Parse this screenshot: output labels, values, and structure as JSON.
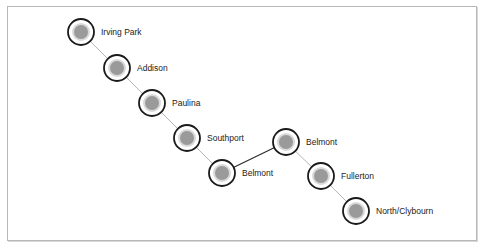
{
  "diagram": {
    "type": "transit-line-network",
    "colors": {
      "frame_border": "#b8b8b8",
      "node_ring": "#1a1a1a",
      "node_halo": "#ffffff",
      "node_inner_ring": "#d9d9d9",
      "node_fill": "#9a9a9a",
      "edge_light": "#b5b5b5",
      "edge_dark": "#2a2a2a",
      "label_text": "#222222"
    },
    "nodes": [
      {
        "id": "irving-park",
        "label": "Irving Park",
        "x": 81,
        "y": 32
      },
      {
        "id": "addison",
        "label": "Addison",
        "x": 117,
        "y": 68
      },
      {
        "id": "paulina",
        "label": "Paulina",
        "x": 152,
        "y": 103
      },
      {
        "id": "southport",
        "label": "Southport",
        "x": 187,
        "y": 138
      },
      {
        "id": "belmont-1",
        "label": "Belmont",
        "x": 222,
        "y": 173
      },
      {
        "id": "belmont-2",
        "label": "Belmont",
        "x": 286,
        "y": 142
      },
      {
        "id": "fullerton",
        "label": "Fullerton",
        "x": 321,
        "y": 176
      },
      {
        "id": "north-clybourn",
        "label": "North/Clybourn",
        "x": 356,
        "y": 211
      }
    ],
    "edges": [
      {
        "from": "irving-park",
        "to": "addison",
        "style": "light"
      },
      {
        "from": "addison",
        "to": "paulina",
        "style": "light"
      },
      {
        "from": "paulina",
        "to": "southport",
        "style": "light"
      },
      {
        "from": "southport",
        "to": "belmont-1",
        "style": "light"
      },
      {
        "from": "belmont-1",
        "to": "belmont-2",
        "style": "dark"
      },
      {
        "from": "belmont-2",
        "to": "fullerton",
        "style": "light"
      },
      {
        "from": "fullerton",
        "to": "north-clybourn",
        "style": "light"
      }
    ]
  }
}
